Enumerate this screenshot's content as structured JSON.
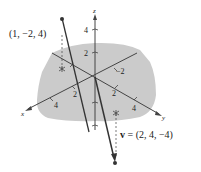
{
  "diagram": {
    "title": "",
    "axes": {
      "x_label": "x",
      "y_label": "y",
      "z_label": "z",
      "x_ticks": [
        "2",
        "4"
      ],
      "y_ticks": [
        "2",
        "4"
      ],
      "z_ticks": [
        "2",
        "4"
      ],
      "neg_y_tick": "−2"
    },
    "point_label": "(1, −2, 4)",
    "vector_label_var": "v",
    "vector_label_rest": " = (2, 4, −4)",
    "colors": {
      "shade": "#c8c8c8",
      "line": "#333333",
      "axis": "#444444",
      "background": "#ffffff"
    }
  }
}
